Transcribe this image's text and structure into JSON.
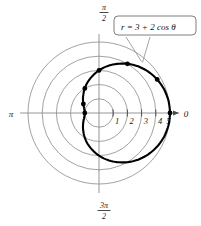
{
  "figure": {
    "kind": "polar-plot",
    "background_color": "#ffffff",
    "curve_color": "#000000",
    "grid_color": "#8a8a8a",
    "point_color": "#000000"
  },
  "callout": {
    "equation": "r = 3 + 2 cos θ",
    "equation_parts": {
      "r": "r",
      "equals": "=",
      "constant": "3",
      "plus": "+",
      "coefficient": "2",
      "trig": "cos",
      "variable": "θ"
    }
  },
  "axes": {
    "right_label": "0",
    "left_label": "π",
    "top_label_numerator": "π",
    "top_label_denominator": "2",
    "bottom_label_numerator": "3π",
    "bottom_label_denominator": "2"
  },
  "ticks": {
    "radial_labels": [
      "1",
      "2",
      "3",
      "4",
      "5"
    ],
    "radial_values": [
      1,
      2,
      3,
      4,
      5
    ]
  },
  "chart_data": {
    "type": "line",
    "title": "",
    "subtitle": "",
    "xlabel": "",
    "ylabel": "",
    "coordinate_system": "polar",
    "equation": "r = 3 + 2 cos θ",
    "curve_name": "limacon",
    "grid": true,
    "grid_circles": [
      1,
      2,
      3,
      4,
      5
    ],
    "rlim": [
      0,
      5
    ],
    "theta_range_rad": [
      0,
      6.283185307179586
    ],
    "legend_position": "none",
    "annotations": [
      {
        "text": "r = 3 + 2 cos θ",
        "type": "callout",
        "anchor_theta_deg": 30,
        "anchor_r": 4.73
      }
    ],
    "marked_points": [
      {
        "theta_deg": 0,
        "theta_label": "0",
        "r": 5.0
      },
      {
        "theta_deg": 30,
        "theta_label": "π/6",
        "r": 4.73
      },
      {
        "theta_deg": 60,
        "theta_label": "π/3",
        "r": 4.0
      },
      {
        "theta_deg": 90,
        "theta_label": "π/2",
        "r": 3.0
      },
      {
        "theta_deg": 120,
        "theta_label": "2π/3",
        "r": 2.0
      },
      {
        "theta_deg": 150,
        "theta_label": "5π/6",
        "r": 1.27
      },
      {
        "theta_deg": 180,
        "theta_label": "π",
        "r": 1.0
      }
    ],
    "series": [
      {
        "name": "r = 3 + 2 cos θ",
        "theta_deg": [
          0,
          10,
          20,
          30,
          40,
          50,
          60,
          70,
          80,
          90,
          100,
          110,
          120,
          130,
          140,
          150,
          160,
          170,
          180,
          190,
          200,
          210,
          220,
          230,
          240,
          250,
          260,
          270,
          280,
          290,
          300,
          310,
          320,
          330,
          340,
          350,
          360
        ],
        "r": [
          5.0,
          4.97,
          4.88,
          4.73,
          4.53,
          4.29,
          4.0,
          3.68,
          3.35,
          3.0,
          2.65,
          2.32,
          2.0,
          1.71,
          1.47,
          1.27,
          1.12,
          1.03,
          1.0,
          1.03,
          1.12,
          1.27,
          1.47,
          1.71,
          2.0,
          2.32,
          2.65,
          3.0,
          3.35,
          3.68,
          4.0,
          4.29,
          4.53,
          4.73,
          4.88,
          4.97,
          5.0
        ]
      }
    ]
  }
}
